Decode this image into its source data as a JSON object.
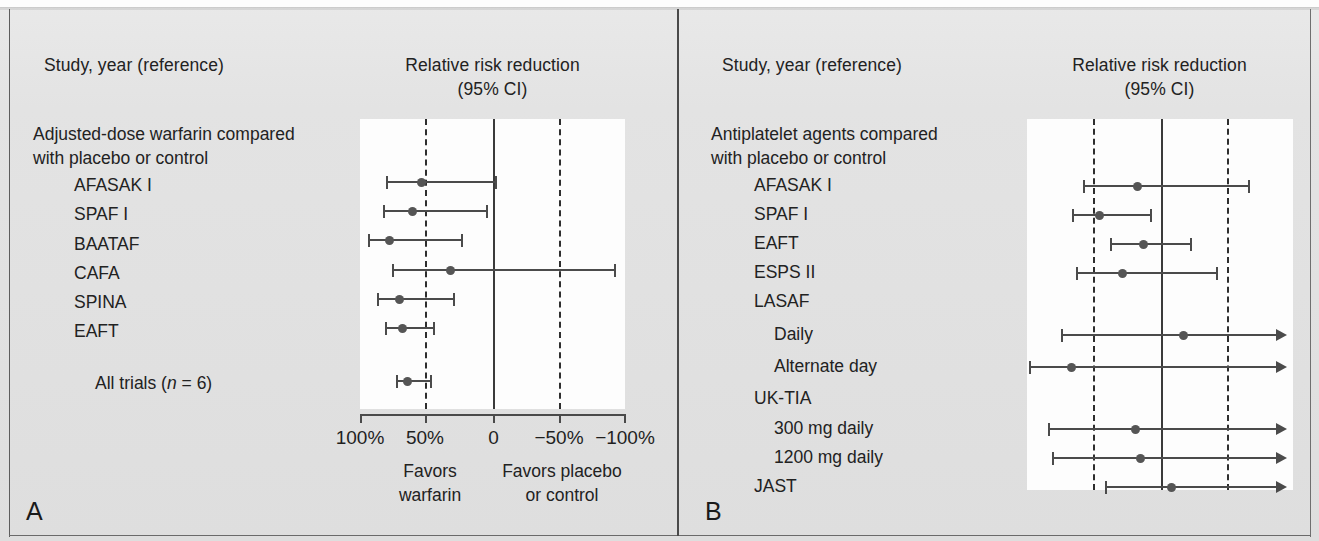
{
  "figure": {
    "panels": [
      {
        "letter": "A",
        "col_header_left": "Study, year (reference)",
        "col_header_right_line1": "Relative risk reduction",
        "col_header_right_line2": "(95% CI)",
        "group_label_line1": "Adjusted-dose warfarin compared",
        "group_label_line2": "with placebo or control",
        "axis": {
          "tick_labels": [
            "100%",
            "50%",
            "0",
            "−50%",
            "−100%"
          ],
          "tick_values": [
            100,
            50,
            0,
            -50,
            -100
          ],
          "reference_line_value": 0,
          "dashed_line_values": [
            50,
            -50
          ]
        },
        "footnote_left_line1": "Favors",
        "footnote_left_line2": "warfarin",
        "footnote_right_line1": "Favors placebo",
        "footnote_right_line2": "or control",
        "rows": [
          {
            "label": "AFASAK I",
            "indent": 1,
            "point": 53,
            "low": 79,
            "high": 0,
            "truncated_right": false
          },
          {
            "label": "SPAF I",
            "indent": 1,
            "point": 60,
            "low": 81,
            "high": 7,
            "truncated_right": false
          },
          {
            "label": "BAATAF",
            "indent": 1,
            "point": 78,
            "low": 93,
            "high": 24,
            "truncated_right": false
          },
          {
            "label": "CAFA",
            "indent": 1,
            "point": 33,
            "low": 75,
            "high": -90,
            "truncated_right": false
          },
          {
            "label": "SPINA",
            "indent": 1,
            "point": 71,
            "low": 87,
            "high": 29,
            "truncated_right": false
          },
          {
            "label": "EAFT",
            "indent": 1,
            "point": 68,
            "low": 81,
            "high": 46,
            "truncated_right": false
          },
          {
            "label": "All trials (n = 6)",
            "indent": 1,
            "point": 64,
            "low": 72,
            "high": 48,
            "truncated_right": false,
            "summary": true,
            "italic_token": "n"
          }
        ]
      },
      {
        "letter": "B",
        "col_header_left": "Study, year (reference)",
        "col_header_right_line1": "Relative risk reduction",
        "col_header_right_line2": "(95% CI)",
        "group_label_line1": "Antiplatelet agents compared",
        "group_label_line2": "with placebo or control",
        "axis": {
          "reference_line_value": 0,
          "dashed_line_values": [
            50,
            -50
          ]
        },
        "rows": [
          {
            "label": "AFASAK I",
            "indent": 1,
            "point": 18,
            "low": 58,
            "high": -64,
            "truncated_right": false
          },
          {
            "label": "SPAF I",
            "indent": 1,
            "point": 46,
            "low": 66,
            "high": 8,
            "truncated_right": false
          },
          {
            "label": "EAFT",
            "indent": 1,
            "point": 13,
            "low": 38,
            "high": -22,
            "truncated_right": false
          },
          {
            "label": "ESPS II",
            "indent": 1,
            "point": 29,
            "low": 63,
            "high": -41,
            "truncated_right": false
          },
          {
            "label": "LASAF",
            "indent": 1,
            "header_only": true
          },
          {
            "label": "Daily",
            "indent": 2,
            "point": -16,
            "low": 74,
            "high": -110,
            "truncated_right": true
          },
          {
            "label": "Alternate day",
            "indent": 2,
            "point": 67,
            "low": 98,
            "high": -110,
            "truncated_right": true
          },
          {
            "label": "UK-TIA",
            "indent": 1,
            "header_only": true
          },
          {
            "label": "300 mg daily",
            "indent": 2,
            "point": 19,
            "low": 84,
            "high": -110,
            "truncated_right": true
          },
          {
            "label": "1200 mg daily",
            "indent": 2,
            "point": 16,
            "low": 81,
            "high": -110,
            "truncated_right": true
          },
          {
            "label": "JAST",
            "indent": 1,
            "point": -7,
            "low": 42,
            "high": -110,
            "truncated_right": true
          }
        ]
      }
    ]
  },
  "chart_data": {
    "type": "forest",
    "xlabel": "Relative risk reduction",
    "panels": [
      {
        "id": "A",
        "subtitle": "Adjusted-dose warfarin compared with placebo or control",
        "xlim": [
          100,
          -100
        ],
        "xticks": [
          100,
          50,
          0,
          -50,
          -100
        ],
        "xtick_labels": [
          "100%",
          "50%",
          "0",
          "−50%",
          "−100%"
        ],
        "reference_line": 0,
        "dashed_lines": [
          50,
          -50
        ],
        "units": "percent relative risk reduction",
        "studies": [
          {
            "name": "AFASAK I",
            "rrr": 53,
            "ci_low": 79,
            "ci_high": 0
          },
          {
            "name": "SPAF I",
            "rrr": 60,
            "ci_low": 81,
            "ci_high": 7
          },
          {
            "name": "BAATAF",
            "rrr": 78,
            "ci_low": 93,
            "ci_high": 24
          },
          {
            "name": "CAFA",
            "rrr": 33,
            "ci_low": 75,
            "ci_high": -90
          },
          {
            "name": "SPINA",
            "rrr": 71,
            "ci_low": 87,
            "ci_high": 29
          },
          {
            "name": "EAFT",
            "rrr": 68,
            "ci_low": 81,
            "ci_high": 46
          },
          {
            "name": "All trials (n = 6)",
            "rrr": 64,
            "ci_low": 72,
            "ci_high": 48,
            "pooled": true
          }
        ],
        "annotations": [
          "Favors warfarin",
          "Favors placebo or control"
        ]
      },
      {
        "id": "B",
        "subtitle": "Antiplatelet agents compared with placebo or control",
        "xlim": [
          100,
          -100
        ],
        "xticks": [],
        "reference_line": 0,
        "dashed_lines": [
          50,
          -50
        ],
        "units": "percent relative risk reduction",
        "studies": [
          {
            "name": "AFASAK I",
            "rrr": 18,
            "ci_low": 58,
            "ci_high": -64
          },
          {
            "name": "SPAF I",
            "rrr": 46,
            "ci_low": 66,
            "ci_high": 8
          },
          {
            "name": "EAFT",
            "rrr": 13,
            "ci_low": 38,
            "ci_high": -22
          },
          {
            "name": "ESPS II",
            "rrr": 29,
            "ci_low": 63,
            "ci_high": -41
          },
          {
            "name": "LASAF Daily",
            "rrr": -16,
            "ci_low": 74,
            "ci_high": null,
            "ci_high_truncated": true
          },
          {
            "name": "LASAF Alternate day",
            "rrr": 67,
            "ci_low": 98,
            "ci_high": null,
            "ci_high_truncated": true
          },
          {
            "name": "UK-TIA 300 mg daily",
            "rrr": 19,
            "ci_low": 84,
            "ci_high": null,
            "ci_high_truncated": true
          },
          {
            "name": "UK-TIA 1200 mg daily",
            "rrr": 16,
            "ci_low": 81,
            "ci_high": null,
            "ci_high_truncated": true
          },
          {
            "name": "JAST",
            "rrr": -7,
            "ci_low": 42,
            "ci_high": null,
            "ci_high_truncated": true
          }
        ]
      }
    ],
    "colors": {
      "marker": "#555555",
      "line": "#4b4b4b",
      "reference": "#3a3a3a",
      "background": "#fdfdfd",
      "page": "#e2e2e2"
    }
  }
}
